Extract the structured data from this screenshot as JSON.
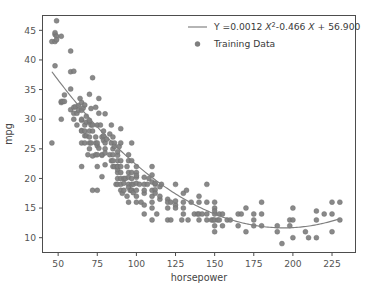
{
  "chart_data": {
    "type": "scatter",
    "title": "",
    "xlabel": "horsepower",
    "ylabel": "mpg",
    "xlim": [
      40,
      240
    ],
    "ylim": [
      7.5,
      47.5
    ],
    "xticks": [
      50,
      75,
      100,
      125,
      150,
      175,
      200,
      225
    ],
    "yticks": [
      10,
      15,
      20,
      25,
      30,
      35,
      40,
      45
    ],
    "grid": false,
    "legend_position": "upper right",
    "series": [
      {
        "name": "fit-curve",
        "label": "Y =0.0012 X² -0.466 X + 56.900",
        "type": "line",
        "color": "#7f7f7f",
        "equation": {
          "prefix": "Y =",
          "a": 0.0012,
          "a_term": "0.0012",
          "x_symbol": "X",
          "power": "2",
          "b_term": "-0.466",
          "b_x_symbol": "X",
          "sign": "+",
          "c_term": "56.900"
        }
      },
      {
        "name": "training-data",
        "label": "Training Data",
        "type": "scatter",
        "color": "#7f7f7f",
        "points": [
          [
            46,
            26.0
          ],
          [
            46,
            43.1
          ],
          [
            48,
            43.1
          ],
          [
            48,
            44.3
          ],
          [
            48,
            44.6
          ],
          [
            48,
            39.0
          ],
          [
            49,
            44.0
          ],
          [
            49,
            46.6
          ],
          [
            49,
            43.4
          ],
          [
            52,
            44.0
          ],
          [
            52,
            32.8
          ],
          [
            52,
            33.0
          ],
          [
            52,
            30.0
          ],
          [
            53,
            33.0
          ],
          [
            54,
            33.0
          ],
          [
            54,
            34.1
          ],
          [
            58,
            31.6
          ],
          [
            58,
            35.1
          ],
          [
            58,
            38.0
          ],
          [
            58,
            41.5
          ],
          [
            60,
            31.0
          ],
          [
            60,
            38.1
          ],
          [
            60,
            30.0
          ],
          [
            60,
            32.0
          ],
          [
            61,
            32.1
          ],
          [
            62,
            31.0
          ],
          [
            62,
            29.0
          ],
          [
            63,
            32.3
          ],
          [
            63,
            31.5
          ],
          [
            64,
            33.5
          ],
          [
            65,
            29.8
          ],
          [
            65,
            32.8
          ],
          [
            65,
            28.1
          ],
          [
            65,
            31.5
          ],
          [
            65,
            26.0
          ],
          [
            65,
            28.0
          ],
          [
            65,
            30.0
          ],
          [
            65,
            22.0
          ],
          [
            66,
            31.9
          ],
          [
            67,
            32.4
          ],
          [
            67,
            27.2
          ],
          [
            67,
            28.0
          ],
          [
            67,
            26.0
          ],
          [
            67,
            29.0
          ],
          [
            68,
            30.5
          ],
          [
            68,
            29.5
          ],
          [
            68,
            27.2
          ],
          [
            69,
            24.0
          ],
          [
            70,
            26.0
          ],
          [
            70,
            27.0
          ],
          [
            70,
            28.0
          ],
          [
            70,
            25.0
          ],
          [
            70,
            34.2
          ],
          [
            70,
            29.5
          ],
          [
            70,
            29.8
          ],
          [
            71,
            31.8
          ],
          [
            71,
            26.0
          ],
          [
            71,
            29.0
          ],
          [
            72,
            28.0
          ],
          [
            72,
            29.0
          ],
          [
            72,
            18.0
          ],
          [
            72,
            23.8
          ],
          [
            72,
            37.0
          ],
          [
            74,
            32.0
          ],
          [
            74,
            27.0
          ],
          [
            74,
            26.0
          ],
          [
            74,
            24.0
          ],
          [
            75,
            25.5
          ],
          [
            75,
            26.0
          ],
          [
            75,
            29.0
          ],
          [
            75,
            22.0
          ],
          [
            75,
            18.0
          ],
          [
            75,
            24.0
          ],
          [
            76,
            33.5
          ],
          [
            76,
            31.0
          ],
          [
            76,
            25.1
          ],
          [
            77,
            29.0
          ],
          [
            78,
            27.0
          ],
          [
            78,
            23.9
          ],
          [
            78,
            20.3
          ],
          [
            78,
            24.0
          ],
          [
            79,
            27.2
          ],
          [
            79,
            28.0
          ],
          [
            79,
            26.4
          ],
          [
            80,
            26.0
          ],
          [
            80,
            30.9
          ],
          [
            80,
            25.0
          ],
          [
            80,
            22.3
          ],
          [
            80,
            24.3
          ],
          [
            81,
            26.6
          ],
          [
            83,
            27.5
          ],
          [
            83,
            24.0
          ],
          [
            84,
            23.0
          ],
          [
            84,
            26.0
          ],
          [
            84,
            29.0
          ],
          [
            85,
            24.0
          ],
          [
            85,
            25.0
          ],
          [
            85,
            22.0
          ],
          [
            85,
            27.0
          ],
          [
            85,
            23.0
          ],
          [
            86,
            22.0
          ],
          [
            86,
            26.0
          ],
          [
            86,
            25.4
          ],
          [
            87,
            19.0
          ],
          [
            88,
            21.0
          ],
          [
            88,
            22.0
          ],
          [
            88,
            19.0
          ],
          [
            88,
            23.0
          ],
          [
            88,
            23.9
          ],
          [
            88,
            24.5
          ],
          [
            88,
            21.5
          ],
          [
            88,
            22.0
          ],
          [
            88,
            20.0
          ],
          [
            89,
            25.4
          ],
          [
            90,
            19.0
          ],
          [
            90,
            20.0
          ],
          [
            90,
            22.0
          ],
          [
            90,
            26.0
          ],
          [
            90,
            23.0
          ],
          [
            90,
            18.0
          ],
          [
            90,
            21.0
          ],
          [
            90,
            28.4
          ],
          [
            91,
            17.5
          ],
          [
            92,
            20.0
          ],
          [
            92,
            18.0
          ],
          [
            92,
            19.2
          ],
          [
            93,
            20.0
          ],
          [
            94,
            17.0
          ],
          [
            94,
            22.0
          ],
          [
            95,
            19.0
          ],
          [
            95,
            21.0
          ],
          [
            95,
            24.0
          ],
          [
            95,
            18.5
          ],
          [
            95,
            20.2
          ],
          [
            95,
            23.0
          ],
          [
            95,
            16.0
          ],
          [
            96,
            18.0
          ],
          [
            97,
            18.0
          ],
          [
            97,
            20.0
          ],
          [
            97,
            19.0
          ],
          [
            97,
            23.0
          ],
          [
            97,
            18.0
          ],
          [
            97,
            21.0
          ],
          [
            97,
            26.0
          ],
          [
            98,
            19.0
          ],
          [
            98,
            17.6
          ],
          [
            100,
            18.0
          ],
          [
            100,
            21.0
          ],
          [
            100,
            17.0
          ],
          [
            100,
            22.0
          ],
          [
            100,
            19.2
          ],
          [
            100,
            20.2
          ],
          [
            100,
            20.5
          ],
          [
            100,
            16.0
          ],
          [
            102,
            19.0
          ],
          [
            103,
            16.0
          ],
          [
            105,
            14.0
          ],
          [
            105,
            17.5
          ],
          [
            105,
            18.0
          ],
          [
            105,
            19.0
          ],
          [
            105,
            15.5
          ],
          [
            105,
            20.2
          ],
          [
            107,
            19.0
          ],
          [
            108,
            20.0
          ],
          [
            110,
            18.0
          ],
          [
            110,
            16.0
          ],
          [
            110,
            15.0
          ],
          [
            110,
            17.0
          ],
          [
            110,
            20.6
          ],
          [
            110,
            19.4
          ],
          [
            110,
            13.0
          ],
          [
            110,
            22.0
          ],
          [
            112,
            19.0
          ],
          [
            112,
            18.1
          ],
          [
            112,
            17.5
          ],
          [
            112,
            19.2
          ],
          [
            113,
            14.0
          ],
          [
            115,
            18.6
          ],
          [
            115,
            16.5
          ],
          [
            115,
            17.0
          ],
          [
            116,
            19.0
          ],
          [
            120,
            15.0
          ],
          [
            120,
            16.5
          ],
          [
            120,
            16.0
          ],
          [
            120,
            13.0
          ],
          [
            122,
            16.0
          ],
          [
            122,
            13.0
          ],
          [
            125,
            15.5
          ],
          [
            125,
            16.2
          ],
          [
            125,
            19.0
          ],
          [
            125,
            15.0
          ],
          [
            129,
            13.0
          ],
          [
            130,
            15.0
          ],
          [
            130,
            16.0
          ],
          [
            130,
            14.0
          ],
          [
            130,
            17.5
          ],
          [
            132,
            18.0
          ],
          [
            133,
            13.0
          ],
          [
            135,
            16.0
          ],
          [
            137,
            14.0
          ],
          [
            139,
            14.0
          ],
          [
            140,
            13.0
          ],
          [
            140,
            16.0
          ],
          [
            140,
            14.0
          ],
          [
            140,
            17.0
          ],
          [
            142,
            14.0
          ],
          [
            145,
            13.0
          ],
          [
            145,
            14.0
          ],
          [
            145,
            16.0
          ],
          [
            145,
            19.0
          ],
          [
            148,
            13.0
          ],
          [
            149,
            13.0
          ],
          [
            150,
            12.0
          ],
          [
            150,
            14.0
          ],
          [
            150,
            13.0
          ],
          [
            150,
            16.0
          ],
          [
            150,
            15.0
          ],
          [
            150,
            11.0
          ],
          [
            150,
            14.5
          ],
          [
            152,
            13.0
          ],
          [
            153,
            13.0
          ],
          [
            153,
            14.0
          ],
          [
            155,
            12.0
          ],
          [
            155,
            14.0
          ],
          [
            158,
            13.0
          ],
          [
            160,
            13.0
          ],
          [
            165,
            12.0
          ],
          [
            165,
            14.0
          ],
          [
            167,
            14.0
          ],
          [
            170,
            11.0
          ],
          [
            170,
            15.0
          ],
          [
            175,
            13.0
          ],
          [
            175,
            12.0
          ],
          [
            175,
            14.0
          ],
          [
            180,
            12.0
          ],
          [
            180,
            14.0
          ],
          [
            180,
            16.0
          ],
          [
            190,
            12.0
          ],
          [
            190,
            11.0
          ],
          [
            193,
            9.0
          ],
          [
            198,
            13.0
          ],
          [
            198,
            12.0
          ],
          [
            200,
            10.0
          ],
          [
            200,
            13.0
          ],
          [
            200,
            15.0
          ],
          [
            208,
            11.0
          ],
          [
            210,
            10.0
          ],
          [
            215,
            10.0
          ],
          [
            215,
            13.0
          ],
          [
            215,
            14.5
          ],
          [
            220,
            14.0
          ],
          [
            225,
            14.0
          ],
          [
            225,
            11.0
          ],
          [
            225,
            16.0
          ],
          [
            230,
            16.0
          ],
          [
            230,
            13.0
          ]
        ]
      }
    ]
  }
}
